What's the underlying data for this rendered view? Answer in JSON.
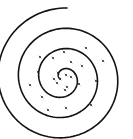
{
  "diagram": {
    "type": "spiral-with-scattered-marks",
    "colors": {
      "background": "#ffffff",
      "stroke": "#111111",
      "marks": "#222222"
    },
    "spiral": {
      "center": [
        63,
        78
      ],
      "end_point": [
        67,
        8
      ],
      "turns": 3.3,
      "direction": "clockwise-outward"
    },
    "marks": [
      [
        40,
        57
      ],
      [
        53,
        58
      ],
      [
        64,
        52
      ],
      [
        71,
        62
      ],
      [
        82,
        66
      ],
      [
        86,
        48
      ],
      [
        103,
        61
      ],
      [
        38,
        72
      ],
      [
        58,
        73
      ],
      [
        66,
        75
      ],
      [
        54,
        79
      ],
      [
        57,
        83
      ],
      [
        65,
        90
      ],
      [
        75,
        74
      ],
      [
        79,
        84
      ],
      [
        67,
        87
      ],
      [
        30,
        85
      ],
      [
        96,
        81
      ],
      [
        42,
        97
      ],
      [
        48,
        110
      ],
      [
        66,
        108
      ],
      [
        91,
        105
      ],
      [
        60,
        79
      ],
      [
        71,
        77
      ]
    ]
  }
}
